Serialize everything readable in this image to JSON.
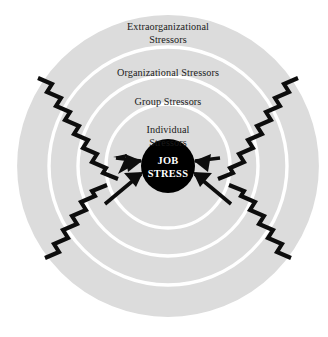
{
  "diagram": {
    "type": "concentric-circles",
    "background_color": "#ffffff",
    "disc_color": "#dcdcdc",
    "ring_line_color": "#ffffff",
    "core_fill_color": "#000000",
    "core_text_color": "#ffffff",
    "bolt_color": "#000000",
    "center": {
      "x": 168,
      "y": 166
    },
    "outer_radius": 152,
    "rings": [
      {
        "name": "extraorganizational",
        "radius": 152,
        "label_lines": [
          "Extraorganizational",
          "Stressors"
        ],
        "label_line1": "Extraorganizational",
        "label_line2": "Stressors",
        "label_y": 30
      },
      {
        "name": "organizational",
        "radius": 119,
        "label_lines": [
          "Organizational Stressors"
        ],
        "label_line1": "Organizational Stressors",
        "label_y": 76
      },
      {
        "name": "group",
        "radius": 90,
        "label_lines": [
          "Group Stressors"
        ],
        "label_line1": "Group Stressors",
        "label_y": 105
      },
      {
        "name": "individual",
        "radius": 62,
        "label_lines": [
          "Individual",
          "Stressors"
        ],
        "label_line1": "Individual",
        "label_line2": "Stressors",
        "label_y": 133
      }
    ],
    "core": {
      "name": "job-stress-core",
      "radius": 27,
      "label_line1": "JOB",
      "label_line2": "STRESS"
    },
    "bolts": [
      {
        "name": "bolt-top-left",
        "origin": "top-left",
        "direction": "down-right"
      },
      {
        "name": "bolt-top-right",
        "origin": "top-right",
        "direction": "down-left"
      },
      {
        "name": "bolt-bottom-left",
        "origin": "bottom-left",
        "direction": "up-right"
      },
      {
        "name": "bolt-bottom-right",
        "origin": "bottom-right",
        "direction": "up-left"
      }
    ]
  }
}
